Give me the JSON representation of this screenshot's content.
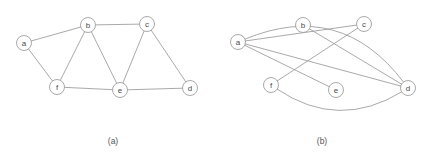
{
  "figure": {
    "width": 428,
    "height": 160,
    "background_color": "#ffffff",
    "node_stroke_color": "#9a9a9a",
    "node_fill_color": "#ffffff",
    "edge_color": "#9a9a9a",
    "label_color": "#4a4a4a",
    "caption_color": "#555555",
    "node_radius": 7.5
  },
  "panels": [
    {
      "id": "panel-a",
      "caption": "(a)",
      "caption_x": 113,
      "caption_y": 141,
      "nodes": [
        {
          "id": "a",
          "label": "a",
          "x": 24,
          "y": 43
        },
        {
          "id": "b",
          "label": "b",
          "x": 88,
          "y": 25
        },
        {
          "id": "c",
          "label": "c",
          "x": 147,
          "y": 24
        },
        {
          "id": "d",
          "label": "d",
          "x": 190,
          "y": 88
        },
        {
          "id": "e",
          "label": "e",
          "x": 120,
          "y": 90
        },
        {
          "id": "f",
          "label": "f",
          "x": 57,
          "y": 87
        }
      ],
      "edges": [
        {
          "from": "a",
          "to": "b",
          "curve": 0
        },
        {
          "from": "a",
          "to": "f",
          "curve": 0
        },
        {
          "from": "b",
          "to": "c",
          "curve": 0
        },
        {
          "from": "b",
          "to": "f",
          "curve": 0
        },
        {
          "from": "b",
          "to": "e",
          "curve": 0
        },
        {
          "from": "c",
          "to": "e",
          "curve": 0
        },
        {
          "from": "c",
          "to": "d",
          "curve": 0
        },
        {
          "from": "f",
          "to": "e",
          "curve": 0
        },
        {
          "from": "e",
          "to": "d",
          "curve": 0
        }
      ]
    },
    {
      "id": "panel-b",
      "caption": "(b)",
      "caption_x": 322,
      "caption_y": 141,
      "nodes": [
        {
          "id": "a",
          "label": "a",
          "x": 238,
          "y": 42
        },
        {
          "id": "b",
          "label": "b",
          "x": 303,
          "y": 25
        },
        {
          "id": "c",
          "label": "c",
          "x": 364,
          "y": 24
        },
        {
          "id": "d",
          "label": "d",
          "x": 408,
          "y": 88
        },
        {
          "id": "e",
          "label": "e",
          "x": 336,
          "y": 90
        },
        {
          "id": "f",
          "label": "f",
          "x": 271,
          "y": 85
        }
      ],
      "edges": [
        {
          "from": "a",
          "to": "d",
          "curve": -34
        },
        {
          "from": "a",
          "to": "d",
          "curve": 0
        },
        {
          "from": "a",
          "to": "e",
          "curve": 0
        },
        {
          "from": "a",
          "to": "c",
          "curve": 0
        },
        {
          "from": "b",
          "to": "d",
          "curve": 0
        },
        {
          "from": "c",
          "to": "f",
          "curve": 0
        },
        {
          "from": "f",
          "to": "d",
          "curve": 22
        }
      ]
    }
  ]
}
